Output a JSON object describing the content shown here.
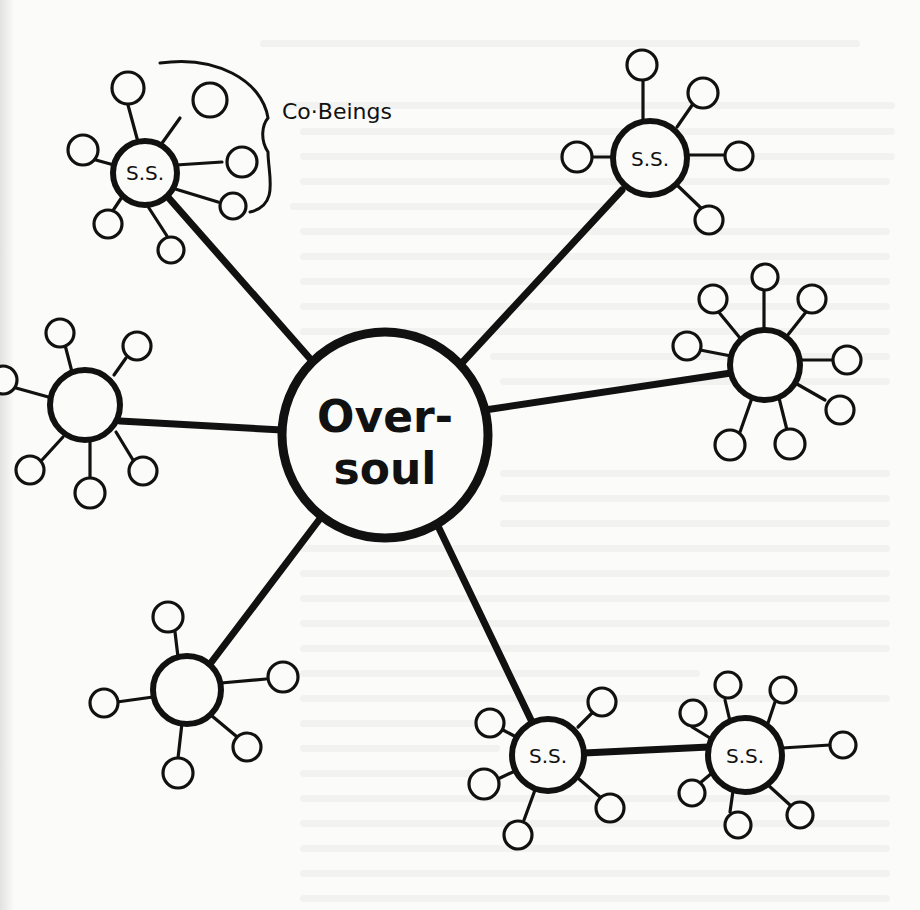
{
  "diagram": {
    "type": "hub-and-spoke network (hand-drawn)",
    "center": {
      "id": "oversoul",
      "label_line1": "Over-",
      "label_line2": "soul",
      "cx": 385,
      "cy": 435,
      "r": 103
    },
    "annotation": {
      "label": "Co·Beings",
      "refers_to": "satellites of top-left S.S. node"
    },
    "nodes": [
      {
        "id": "ss-top-left",
        "label": "S.S.",
        "cx": 145,
        "cy": 173,
        "r": 32,
        "satellites": 7,
        "linked_to": "oversoul"
      },
      {
        "id": "ss-top-right",
        "label": "S.S.",
        "cx": 650,
        "cy": 158,
        "r": 37,
        "satellites": 5,
        "linked_to": "oversoul"
      },
      {
        "id": "hub-left",
        "label": "",
        "cx": 85,
        "cy": 405,
        "r": 35,
        "satellites": 6,
        "linked_to": "oversoul"
      },
      {
        "id": "hub-right",
        "label": "",
        "cx": 765,
        "cy": 365,
        "r": 35,
        "satellites": 8,
        "linked_to": "oversoul"
      },
      {
        "id": "hub-bottom-left",
        "label": "",
        "cx": 187,
        "cy": 690,
        "r": 34,
        "satellites": 5,
        "linked_to": "oversoul"
      },
      {
        "id": "ss-bottom-mid",
        "label": "S.S.",
        "cx": 548,
        "cy": 755,
        "r": 36,
        "satellites": 5,
        "linked_to": "oversoul"
      },
      {
        "id": "ss-bottom-right",
        "label": "S.S.",
        "cx": 745,
        "cy": 755,
        "r": 37,
        "satellites": 7,
        "linked_to": "ss-bottom-mid"
      }
    ],
    "colors": {
      "ink": "#111111",
      "paper": "#fbfbf9"
    }
  }
}
